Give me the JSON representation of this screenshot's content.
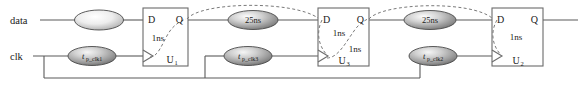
{
  "diagram": {
    "colors": {
      "wire": "#5a5a5a",
      "box_stroke": "#6b6b6b",
      "dashed_arc": "#7a7a7a",
      "text": "#1a1a1a",
      "ellipse_edge": "#4a4a4a",
      "ellipse_fill_light": "#f2f2f2",
      "ellipse_fill_dark": "#8e8e8e"
    },
    "inputs": [
      {
        "name": "data-input-label",
        "label": "data"
      },
      {
        "name": "clk-input-label",
        "label": "clk"
      }
    ],
    "flipflops": [
      {
        "id": "U1",
        "unit_base": "U",
        "unit_sub": "1",
        "pin_d": "D",
        "pin_q": "Q",
        "internal_delays": [
          "1ns"
        ]
      },
      {
        "id": "U3",
        "unit_base": "U",
        "unit_sub": "3",
        "pin_d": "D",
        "pin_q": "Q",
        "internal_delays": [
          "1ns",
          "1ns"
        ]
      },
      {
        "id": "U2",
        "unit_base": "U",
        "unit_sub": "2",
        "pin_d": "D",
        "pin_q": "Q",
        "internal_delays": [
          "1ns"
        ]
      }
    ],
    "net_delay_nodes": [
      {
        "name": "data-net-delay",
        "label": ""
      },
      {
        "name": "q1-to-d3-net-delay",
        "label": "25ns"
      },
      {
        "name": "q3-to-d2-net-delay",
        "label": "25ns"
      }
    ],
    "clock_delay_nodes": [
      {
        "name": "clk-delay-u1",
        "base": "t",
        "sub": "p_clk1"
      },
      {
        "name": "clk-delay-u3",
        "base": "t",
        "sub": "p_clk3"
      },
      {
        "name": "clk-delay-u2",
        "base": "t",
        "sub": "p_clk2"
      }
    ]
  }
}
